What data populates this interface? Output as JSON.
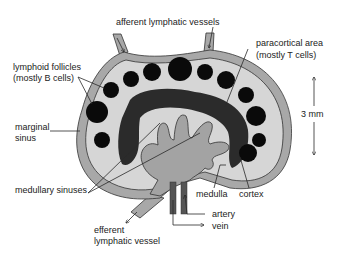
{
  "diagram": {
    "colors": {
      "capsule": "#a8a8a8",
      "cortex": "#d6d6d6",
      "follicle": "#0a0a0a",
      "paracortex": "#2b2b2b",
      "medulla": "#a3a3a3",
      "outline": "#333333",
      "vessel_dark": "#555555"
    },
    "labels": {
      "afferent": "afferent lymphatic vessels",
      "follicles_line1": "lymphoid follicles",
      "follicles_line2": "(mostly B cells)",
      "paracortical_line1": "paracortical area",
      "paracortical_line2": "(mostly T cells)",
      "marginal_line1": "marginal",
      "marginal_line2": "sinus",
      "medullary": "medullary sinuses",
      "medulla": "medulla",
      "cortex": "cortex",
      "efferent_line1": "efferent",
      "efferent_line2": "lymphatic vessel",
      "artery": "artery",
      "vein": "vein",
      "scale": "3 mm"
    }
  }
}
